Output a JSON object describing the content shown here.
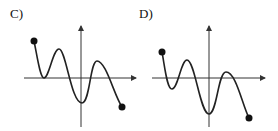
{
  "graphs": [
    {
      "label": "C)",
      "description": "Curve starting at closed dot upper-left, touching x-axis, rising to a peak, falling to a minimum at the y-axis, rising to a smaller peak, ending at closed dot lower-right"
    },
    {
      "label": "D)",
      "description": "Curve starting at closed dot upper-left, dipping below x-axis, rising to a peak, falling to a minimum at the y-axis, rising to a peak above x-axis, ending at closed dot lower-right"
    }
  ],
  "colors": {
    "stroke": "#222222",
    "axis": "#333333"
  }
}
